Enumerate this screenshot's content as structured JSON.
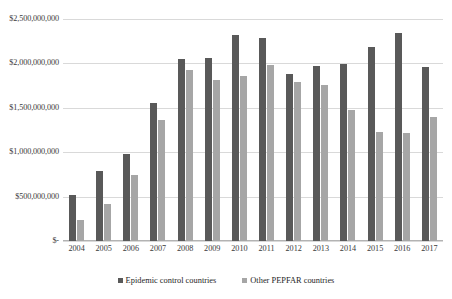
{
  "chart_data": {
    "type": "bar",
    "title": "",
    "subtitle": "",
    "xlabel": "",
    "ylabel": "",
    "grid": true,
    "legend_position": "bottom",
    "ylim": [
      0,
      2500000000
    ],
    "categories": [
      "2004",
      "2005",
      "2006",
      "2007",
      "2008",
      "2009",
      "2010",
      "2011",
      "2012",
      "2013",
      "2014",
      "2015",
      "2016",
      "2017"
    ],
    "ytick_labels": [
      "$2,500,000,000",
      "$2,000,000,000",
      "$1,500,000,000",
      "$1,000,000,000",
      "$500,000,000",
      "$-"
    ],
    "ytick_values": [
      2500000000,
      2000000000,
      1500000000,
      1000000000,
      500000000,
      0
    ],
    "series": [
      {
        "name": "Epidemic control countries",
        "color": "#595959",
        "values": [
          520000000,
          790000000,
          975000000,
          1555000000,
          2055000000,
          2065000000,
          2320000000,
          2290000000,
          1880000000,
          1970000000,
          1990000000,
          2190000000,
          2340000000,
          1960000000
        ]
      },
      {
        "name": "Other PEPFAR countries",
        "color": "#a6a6a6",
        "values": [
          240000000,
          420000000,
          745000000,
          1360000000,
          1925000000,
          1810000000,
          1855000000,
          1980000000,
          1790000000,
          1760000000,
          1470000000,
          1230000000,
          1220000000,
          1400000000
        ]
      }
    ]
  }
}
